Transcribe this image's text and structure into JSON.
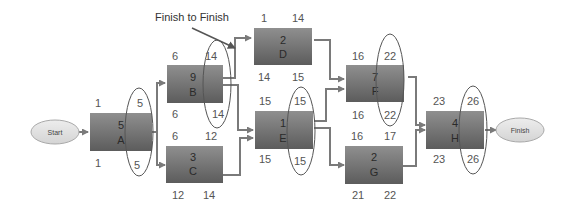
{
  "annotation": {
    "text": "Finish to Finish"
  },
  "terminals": {
    "start": {
      "label": "Start"
    },
    "finish": {
      "label": "Finish"
    }
  },
  "colors": {
    "box_top": "#8e8e8e",
    "box_bottom": "#5e5e5e",
    "terminal_fill": "#e4e4e4",
    "line": "#7a7a7a",
    "highlight_oval": "#555555"
  },
  "activities": [
    {
      "id": "A",
      "duration": "5",
      "es": "1",
      "ef": "5",
      "ls": "1",
      "lf": "5"
    },
    {
      "id": "B",
      "duration": "9",
      "es": "6",
      "ef": "14",
      "ls": "6",
      "lf": "14"
    },
    {
      "id": "C",
      "duration": "3",
      "es": "6",
      "ef": "12",
      "ls": "12",
      "lf": "14"
    },
    {
      "id": "D",
      "duration": "2",
      "es": "1",
      "ef": "14",
      "ls": "14",
      "lf": "15"
    },
    {
      "id": "E",
      "duration": "1",
      "es": "15",
      "ef": "15",
      "ls": "15",
      "lf": "15"
    },
    {
      "id": "F",
      "duration": "7",
      "es": "16",
      "ef": "22",
      "ls": "16",
      "lf": "22"
    },
    {
      "id": "G",
      "duration": "2",
      "es": "16",
      "ef": "17",
      "ls": "21",
      "lf": "22"
    },
    {
      "id": "H",
      "duration": "4",
      "es": "23",
      "ef": "26",
      "ls": "23",
      "lf": "26"
    }
  ]
}
